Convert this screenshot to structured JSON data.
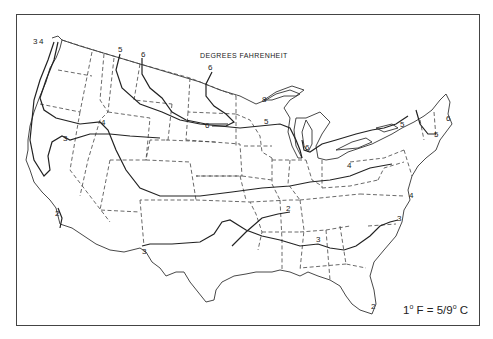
{
  "map": {
    "title": "DEGREES FAHRENHEIT",
    "legend": {
      "prefix": "1",
      "deg1": "o",
      "mid": " F = 5/9",
      "deg2": "o",
      "suffix": " C"
    },
    "region": "Contiguous United States",
    "line_styles": {
      "state_boundaries": "dashed",
      "isolines": "solid"
    },
    "isoline_labels": [
      {
        "value": "3",
        "x": 33,
        "y": 44
      },
      {
        "value": "4",
        "x": 39,
        "y": 44
      },
      {
        "value": "5",
        "x": 121,
        "y": 50
      },
      {
        "value": "6",
        "x": 143,
        "y": 55
      },
      {
        "value": "6",
        "x": 210,
        "y": 69
      },
      {
        "value": "4",
        "x": 104,
        "y": 125
      },
      {
        "value": "3",
        "x": 66,
        "y": 142
      },
      {
        "value": "2",
        "x": 58,
        "y": 216
      },
      {
        "value": "6",
        "x": 207,
        "y": 126
      },
      {
        "value": "5",
        "x": 267,
        "y": 124
      },
      {
        "value": "8",
        "x": 264,
        "y": 101
      },
      {
        "value": "6",
        "x": 308,
        "y": 148
      },
      {
        "value": "4",
        "x": 350,
        "y": 167
      },
      {
        "value": "4",
        "x": 410,
        "y": 198
      },
      {
        "value": "5",
        "x": 401,
        "y": 126
      },
      {
        "value": "5",
        "x": 436,
        "y": 136
      },
      {
        "value": "6",
        "x": 448,
        "y": 120
      },
      {
        "value": "2",
        "x": 287,
        "y": 210
      },
      {
        "value": "3",
        "x": 144,
        "y": 252
      },
      {
        "value": "3",
        "x": 318,
        "y": 240
      },
      {
        "value": "3",
        "x": 397,
        "y": 219
      },
      {
        "value": "2",
        "x": 372,
        "y": 307
      }
    ],
    "isoline_values": [
      2,
      3,
      4,
      5,
      6,
      8
    ]
  }
}
